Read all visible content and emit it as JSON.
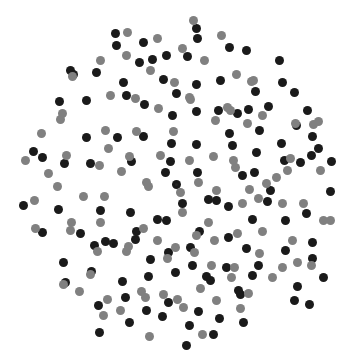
{
  "figure": {
    "title": "",
    "background_color": "#ffffff",
    "width": 355,
    "height": 361
  },
  "chart_data": {
    "type": "scatter",
    "title": "",
    "xlabel": "",
    "ylabel": "",
    "xlim": [
      0,
      355
    ],
    "ylim": [
      0,
      361
    ],
    "grid": false,
    "axes_visible": false,
    "legend": null,
    "legend_position": "none",
    "marker": "circle",
    "default_marker_size_px": 9,
    "series": [
      {
        "name": "dark",
        "color": "#1a1a1a",
        "marker_size_px": 9,
        "count": 122,
        "points": [
          [
            143,
            42
          ],
          [
            115,
            33
          ],
          [
            166,
            55
          ],
          [
            196,
            28
          ],
          [
            197,
            38
          ],
          [
            116,
            45
          ],
          [
            152,
            59
          ],
          [
            139,
            62
          ],
          [
            187,
            56
          ],
          [
            229,
            47
          ],
          [
            246,
            50
          ],
          [
            279,
            60
          ],
          [
            70,
            70
          ],
          [
            73,
            74
          ],
          [
            96,
            72
          ],
          [
            163,
            79
          ],
          [
            196,
            84
          ],
          [
            220,
            80
          ],
          [
            123,
            82
          ],
          [
            282,
            82
          ],
          [
            255,
            91
          ],
          [
            126,
            95
          ],
          [
            176,
            93
          ],
          [
            59,
            101
          ],
          [
            86,
            100
          ],
          [
            218,
            110
          ],
          [
            248,
            109
          ],
          [
            294,
            92
          ],
          [
            144,
            104
          ],
          [
            172,
            115
          ],
          [
            237,
            113
          ],
          [
            268,
            106
          ],
          [
            307,
            110
          ],
          [
            196,
            111
          ],
          [
            86,
            137
          ],
          [
            117,
            137
          ],
          [
            143,
            136
          ],
          [
            196,
            144
          ],
          [
            229,
            133
          ],
          [
            259,
            130
          ],
          [
            232,
            145
          ],
          [
            296,
            125
          ],
          [
            312,
            136
          ],
          [
            33,
            151
          ],
          [
            42,
            157
          ],
          [
            64,
            163
          ],
          [
            90,
            163
          ],
          [
            131,
            161
          ],
          [
            171,
            143
          ],
          [
            170,
            161
          ],
          [
            256,
            152
          ],
          [
            281,
            143
          ],
          [
            311,
            155
          ],
          [
            318,
            148
          ],
          [
            23,
            205
          ],
          [
            58,
            209
          ],
          [
            100,
            210
          ],
          [
            130,
            212
          ],
          [
            165,
            172
          ],
          [
            166,
            220
          ],
          [
            176,
            184
          ],
          [
            197,
            172
          ],
          [
            216,
            200
          ],
          [
            208,
            199
          ],
          [
            242,
            175
          ],
          [
            254,
            172
          ],
          [
            270,
            190
          ],
          [
            284,
            160
          ],
          [
            300,
            162
          ],
          [
            330,
            191
          ],
          [
            331,
            161
          ],
          [
            42,
            232
          ],
          [
            80,
            233
          ],
          [
            113,
            243
          ],
          [
            136,
            231
          ],
          [
            157,
            219
          ],
          [
            182,
            203
          ],
          [
            199,
            231
          ],
          [
            228,
            206
          ],
          [
            252,
            219
          ],
          [
            267,
            201
          ],
          [
            285,
            220
          ],
          [
            306,
            213
          ],
          [
            312,
            242
          ],
          [
            63,
            262
          ],
          [
            94,
            245
          ],
          [
            105,
            241
          ],
          [
            135,
            239
          ],
          [
            150,
            259
          ],
          [
            168,
            252
          ],
          [
            175,
            272
          ],
          [
            190,
            247
          ],
          [
            228,
            237
          ],
          [
            246,
            248
          ],
          [
            258,
            265
          ],
          [
            285,
            250
          ],
          [
            312,
            258
          ],
          [
            323,
            277
          ],
          [
            65,
            282
          ],
          [
            91,
            271
          ],
          [
            122,
            281
          ],
          [
            148,
            276
          ],
          [
            192,
            265
          ],
          [
            210,
            280
          ],
          [
            226,
            267
          ],
          [
            238,
            290
          ],
          [
            252,
            275
          ],
          [
            297,
            286
          ],
          [
            125,
            297
          ],
          [
            168,
            302
          ],
          [
            198,
            311
          ],
          [
            162,
            316
          ],
          [
            206,
            276
          ],
          [
            294,
            300
          ],
          [
            309,
            304
          ],
          [
            98,
            305
          ],
          [
            99,
            332
          ],
          [
            129,
            322
          ],
          [
            146,
            310
          ],
          [
            189,
            325
          ],
          [
            219,
            318
          ],
          [
            243,
            322
          ],
          [
            213,
            334
          ],
          [
            186,
            345
          ],
          [
            240,
            294
          ]
        ]
      },
      {
        "name": "gray",
        "color": "#808080",
        "marker_size_px": 9,
        "color_alt": "#8c8c8c",
        "count": 108,
        "points": [
          [
            127,
            32
          ],
          [
            193,
            20
          ],
          [
            157,
            38
          ],
          [
            221,
            35
          ],
          [
            182,
            48
          ],
          [
            126,
            55
          ],
          [
            204,
            60
          ],
          [
            72,
            76
          ],
          [
            100,
            60
          ],
          [
            150,
            70
          ],
          [
            174,
            82
          ],
          [
            236,
            74
          ],
          [
            251,
            81
          ],
          [
            110,
            95
          ],
          [
            135,
            98
          ],
          [
            189,
            97
          ],
          [
            227,
            107
          ],
          [
            253,
            80
          ],
          [
            62,
            113
          ],
          [
            60,
            119
          ],
          [
            105,
            130
          ],
          [
            158,
            108
          ],
          [
            190,
            99
          ],
          [
            230,
            110
          ],
          [
            262,
            115
          ],
          [
            295,
            123
          ],
          [
            41,
            133
          ],
          [
            108,
            148
          ],
          [
            136,
            131
          ],
          [
            173,
            131
          ],
          [
            215,
            120
          ],
          [
            247,
            123
          ],
          [
            290,
            158
          ],
          [
            313,
            124
          ],
          [
            318,
            121
          ],
          [
            25,
            160
          ],
          [
            66,
            155
          ],
          [
            99,
            165
          ],
          [
            129,
            156
          ],
          [
            160,
            155
          ],
          [
            189,
            160
          ],
          [
            213,
            156
          ],
          [
            233,
            160
          ],
          [
            287,
            170
          ],
          [
            320,
            170
          ],
          [
            48,
            173
          ],
          [
            121,
            171
          ],
          [
            146,
            182
          ],
          [
            198,
            182
          ],
          [
            235,
            167
          ],
          [
            249,
            189
          ],
          [
            276,
            177
          ],
          [
            34,
            200
          ],
          [
            57,
            186
          ],
          [
            83,
            196
          ],
          [
            104,
            196
          ],
          [
            148,
            186
          ],
          [
            182,
            212
          ],
          [
            216,
            190
          ],
          [
            266,
            183
          ],
          [
            303,
            203
          ],
          [
            330,
            220
          ],
          [
            35,
            228
          ],
          [
            71,
            222
          ],
          [
            100,
            222
          ],
          [
            143,
            228
          ],
          [
            180,
            192
          ],
          [
            208,
            222
          ],
          [
            242,
            203
          ],
          [
            258,
            198
          ],
          [
            282,
            203
          ],
          [
            292,
            240
          ],
          [
            323,
            220
          ],
          [
            70,
            230
          ],
          [
            97,
            251
          ],
          [
            128,
            246
          ],
          [
            157,
            240
          ],
          [
            175,
            247
          ],
          [
            196,
            235
          ],
          [
            214,
            240
          ],
          [
            237,
            233
          ],
          [
            262,
            231
          ],
          [
            282,
            267
          ],
          [
            311,
            265
          ],
          [
            63,
            284
          ],
          [
            90,
            274
          ],
          [
            126,
            251
          ],
          [
            167,
            258
          ],
          [
            194,
            252
          ],
          [
            211,
            265
          ],
          [
            234,
            267
          ],
          [
            259,
            253
          ],
          [
            297,
            262
          ],
          [
            79,
            291
          ],
          [
            107,
            299
          ],
          [
            141,
            291
          ],
          [
            163,
            294
          ],
          [
            177,
            299
          ],
          [
            200,
            288
          ],
          [
            231,
            277
          ],
          [
            248,
            293
          ],
          [
            272,
            277
          ],
          [
            103,
            315
          ],
          [
            120,
            310
          ],
          [
            145,
            297
          ],
          [
            183,
            307
          ],
          [
            216,
            300
          ],
          [
            240,
            308
          ],
          [
            202,
            334
          ],
          [
            149,
            336
          ]
        ]
      },
      {
        "name": "tiny-outlier",
        "color": "#262626",
        "marker_size_px": 3,
        "count": 1,
        "points": [
          [
            176,
            184
          ]
        ]
      }
    ]
  }
}
